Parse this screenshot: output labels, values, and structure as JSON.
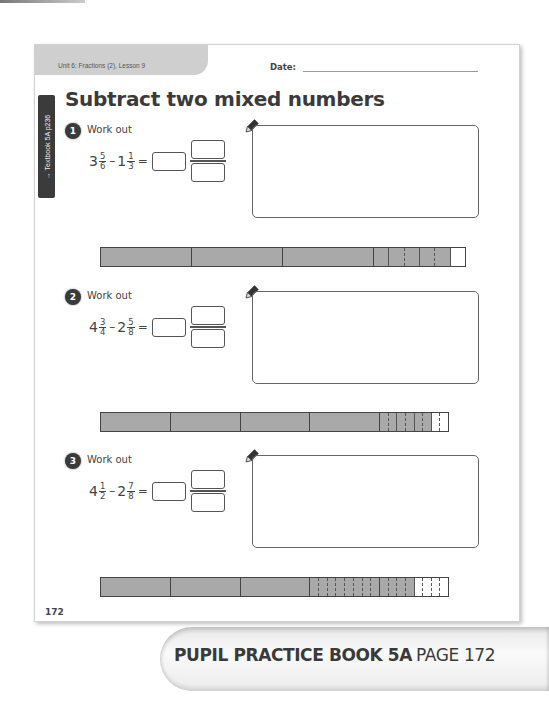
{
  "header": {
    "unit_label": "Unit 6: Fractions (2), Lesson 9",
    "date_label": "Date:",
    "side_tab": "→ Textbook 5A p236",
    "title": "Subtract two mixed numbers"
  },
  "questions": [
    {
      "number": "1",
      "label": "Work out",
      "a_whole": "3",
      "a_num": "5",
      "a_den": "6",
      "operator": "–",
      "b_whole": "1",
      "b_num": "1",
      "b_den": "3",
      "equals": "=",
      "bar": {
        "whole_units": 4,
        "shaded_full_units": 3,
        "partial_unit_parts": 6,
        "partial_unit_shaded": 5
      }
    },
    {
      "number": "2",
      "label": "Work out",
      "a_whole": "4",
      "a_num": "3",
      "a_den": "4",
      "operator": "–",
      "b_whole": "2",
      "b_num": "5",
      "b_den": "8",
      "equals": "=",
      "bar": {
        "whole_units": 5,
        "shaded_full_units": 4,
        "partial_unit_parts": 4,
        "partial_unit_shaded": 3
      }
    },
    {
      "number": "3",
      "label": "Work out",
      "a_whole": "4",
      "a_num": "1",
      "a_den": "2",
      "operator": "–",
      "b_whole": "2",
      "b_num": "7",
      "b_den": "8",
      "equals": "=",
      "bar": {
        "whole_units": 5,
        "shaded_full_units": 4,
        "partial_unit_parts": 8,
        "partial_unit_shaded": 4
      }
    }
  ],
  "footer": {
    "page_number": "172",
    "banner_book": "PUPIL PRACTICE BOOK 5A",
    "banner_page": "PAGE 172"
  },
  "colors": {
    "shaded": "#a9a9a9",
    "tab": "#cfcfcf",
    "dark": "#3a3a3a"
  }
}
